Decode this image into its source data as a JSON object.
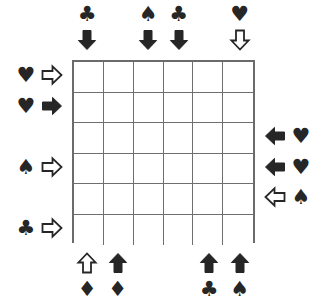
{
  "puzzle": {
    "title": "Card suit arrow grid puzzle",
    "grid": {
      "rows": 6,
      "columns": 6,
      "cell_values": [
        [
          "",
          "",
          "",
          "",
          "",
          ""
        ],
        [
          "",
          "",
          "",
          "",
          "",
          ""
        ],
        [
          "",
          "",
          "",
          "",
          "",
          ""
        ],
        [
          "",
          "",
          "",
          "",
          "",
          ""
        ],
        [
          "",
          "",
          "",
          "",
          "",
          ""
        ],
        [
          "",
          "",
          "",
          "",
          "",
          ""
        ]
      ],
      "line_color": "#6b6b6b",
      "cell_fill": "#ffffff"
    },
    "symbol_color": "#262626",
    "glyphs": {
      "heart": "♥",
      "spade": "♠",
      "club": "♣",
      "diamond": "♦"
    },
    "clues": [
      {
        "id": "top-col-1",
        "side": "top",
        "index": 1,
        "suit": "club",
        "glyph": "♣",
        "arrow": "down",
        "arrow_style": "filled"
      },
      {
        "id": "top-col-3",
        "side": "top",
        "index": 3,
        "suit": "spade",
        "glyph": "♠",
        "arrow": "down",
        "arrow_style": "filled"
      },
      {
        "id": "top-col-4",
        "side": "top",
        "index": 4,
        "suit": "club",
        "glyph": "♣",
        "arrow": "down",
        "arrow_style": "filled"
      },
      {
        "id": "top-col-6",
        "side": "top",
        "index": 6,
        "suit": "heart",
        "glyph": "♥",
        "arrow": "down",
        "arrow_style": "hollow"
      },
      {
        "id": "left-row-1",
        "side": "left",
        "index": 1,
        "suit": "heart",
        "glyph": "♥",
        "arrow": "right",
        "arrow_style": "hollow"
      },
      {
        "id": "left-row-2",
        "side": "left",
        "index": 2,
        "suit": "heart",
        "glyph": "♥",
        "arrow": "right",
        "arrow_style": "filled"
      },
      {
        "id": "left-row-4",
        "side": "left",
        "index": 4,
        "suit": "spade",
        "glyph": "♠",
        "arrow": "right",
        "arrow_style": "hollow"
      },
      {
        "id": "left-row-6",
        "side": "left",
        "index": 6,
        "suit": "club",
        "glyph": "♣",
        "arrow": "right",
        "arrow_style": "hollow"
      },
      {
        "id": "right-row-3",
        "side": "right",
        "index": 3,
        "suit": "heart",
        "glyph": "♥",
        "arrow": "left",
        "arrow_style": "filled"
      },
      {
        "id": "right-row-4",
        "side": "right",
        "index": 4,
        "suit": "heart",
        "glyph": "♥",
        "arrow": "left",
        "arrow_style": "filled"
      },
      {
        "id": "right-row-5",
        "side": "right",
        "index": 5,
        "suit": "spade",
        "glyph": "♠",
        "arrow": "left",
        "arrow_style": "hollow"
      },
      {
        "id": "bottom-col-1",
        "side": "bottom",
        "index": 1,
        "suit": "diamond",
        "glyph": "♦",
        "arrow": "up",
        "arrow_style": "hollow"
      },
      {
        "id": "bottom-col-2",
        "side": "bottom",
        "index": 2,
        "suit": "diamond",
        "glyph": "♦",
        "arrow": "up",
        "arrow_style": "filled"
      },
      {
        "id": "bottom-col-5",
        "side": "bottom",
        "index": 5,
        "suit": "club",
        "glyph": "♣",
        "arrow": "up",
        "arrow_style": "filled"
      },
      {
        "id": "bottom-col-6",
        "side": "bottom",
        "index": 6,
        "suit": "spade",
        "glyph": "♠",
        "arrow": "up",
        "arrow_style": "filled"
      }
    ],
    "geometry": {
      "grid_left": 72,
      "grid_top": 60,
      "cell_size": 30.5,
      "suit_offset": 46,
      "arrow_offset": 20
    }
  }
}
